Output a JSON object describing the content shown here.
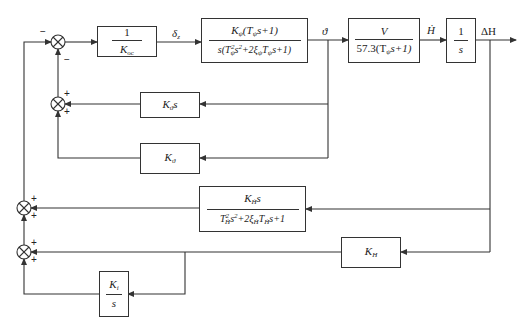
{
  "diagram": {
    "type": "control-system-block-diagram",
    "blocks": {
      "k_oc": {
        "num": "1",
        "den": "K",
        "den_sub": "oc"
      },
      "attitude_plant": {
        "num_main": "K",
        "num_sub": "ψ",
        "num_rest": "(T",
        "num_rest_sub": "ψ",
        "num_tail": "s+1)",
        "den": "s(T²ψs²+2ξψTψs+1)",
        "den_a": "s(T",
        "den_a_sub": "ψ",
        "den_a_sup": "2",
        "den_b": "s",
        "den_b_sup": "2",
        "den_c": "+2ξ",
        "den_c_sub": "ψ",
        "den_d": "T",
        "den_d_sub": "ψ",
        "den_e": "s+1)"
      },
      "velocity": {
        "num": "V",
        "den_a": "57.3(T",
        "den_sub": "ψ",
        "den_b": "s+1)"
      },
      "integrator": {
        "num": "1",
        "den": "s"
      },
      "k_theta_dot": {
        "main": "K",
        "sub": "ϑ̇",
        "tail": "s"
      },
      "k_theta": {
        "main": "K",
        "sub": "ϑ"
      },
      "k_h_dot": {
        "num_main": "K",
        "num_sub": "Ḣ",
        "num_tail": "s",
        "den_a": "T",
        "den_a_sup": "2",
        "den_a_sub": "Ḣ",
        "den_b": "s",
        "den_b_sup": "2",
        "den_c": "+2ξ",
        "den_c_sub": "Ḣ",
        "den_d": "T",
        "den_d_sub": "Ḣ",
        "den_e": "s+1"
      },
      "k_h": {
        "main": "K",
        "sub": "H"
      },
      "k_i": {
        "num_main": "K",
        "num_sub": "i",
        "den": "s"
      }
    },
    "signals": {
      "delta_z": {
        "main": "δ",
        "sub": "z"
      },
      "theta": "ϑ",
      "h_dot": "Ḣ",
      "delta_h": "ΔH"
    },
    "junction_signs": {
      "s1_left": "−",
      "s1_bottom": "−",
      "s2_top": "+",
      "s2_bottom": "+",
      "s3_top": "+",
      "s3_bottom": "+",
      "s4_top": "+",
      "s4_bottom": "+"
    }
  }
}
